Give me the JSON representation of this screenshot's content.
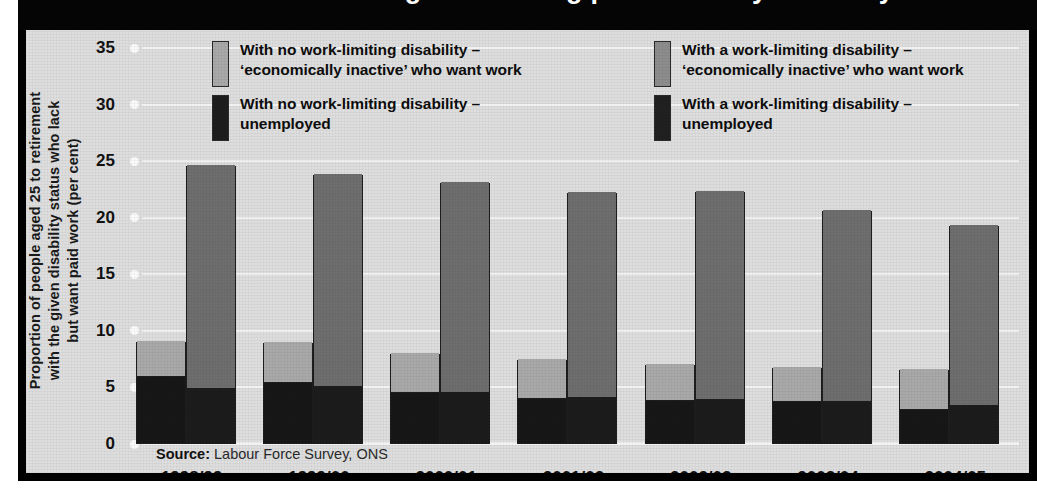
{
  "title": "Lacking but wanting paid work: by disability status",
  "ylabel_lines": [
    "Proportion of people aged 25 to retirement",
    "with the given disability status who lack",
    "but want paid work (per cent)"
  ],
  "source": {
    "prefix": "Source:",
    "text": " Labour Force Survey, ONS"
  },
  "legend": [
    {
      "swatch": "sw-nodis-inactive",
      "icon": "legend-swatch-light-grey",
      "line1": "With no work-limiting disability –",
      "line2": "‘economically inactive’ who want work"
    },
    {
      "swatch": "sw-nodis-unemp",
      "icon": "legend-swatch-black",
      "line1": "With no work-limiting disability –",
      "line2": "unemployed"
    },
    {
      "swatch": "sw-dis-inactive",
      "icon": "legend-swatch-mid-grey",
      "line1": "With a work-limiting disability –",
      "line2": "‘economically inactive’ who want work"
    },
    {
      "swatch": "sw-dis-unemp",
      "icon": "legend-swatch-dark",
      "line1": "With a work-limiting disability –",
      "line2": "unemployed"
    }
  ],
  "colors": {
    "panel_background": "#dedede",
    "frame": "#000000",
    "gridline": "#f4f4f4",
    "no_disability_inactive": "#a9a9a9",
    "no_disability_unemployed": "#171717",
    "disability_inactive": "#6e6e6e",
    "disability_unemployed": "#1c1c1c"
  },
  "chart_data": {
    "type": "bar",
    "subtype": "grouped-stacked",
    "title": "Lacking but wanting paid work: by disability status",
    "xlabel": "",
    "ylabel": "Proportion of people aged 25 to retirement with the given disability status who lack but want paid work (per cent)",
    "ylim": [
      0,
      35
    ],
    "yticks": [
      0,
      5,
      10,
      15,
      20,
      25,
      30,
      35
    ],
    "ytick_labels": [
      "0",
      "5",
      "10",
      "15",
      "20",
      "25",
      "30",
      "35"
    ],
    "grid": true,
    "legend_position": "top",
    "categories": [
      "1998/99",
      "1999/00",
      "2000/01",
      "2001/02",
      "2002/03",
      "2003/04",
      "2004/05"
    ],
    "series": [
      {
        "name": "With no work-limiting disability – unemployed",
        "group": "no-disability",
        "stack_order": 1,
        "color": "#171717",
        "values": [
          5.9,
          5.4,
          4.5,
          4.0,
          3.8,
          3.7,
          3.0
        ]
      },
      {
        "name": "With no work-limiting disability – ‘economically inactive’ who want work",
        "group": "no-disability",
        "stack_order": 2,
        "color": "#a9a9a9",
        "values": [
          3.1,
          3.5,
          3.5,
          3.4,
          3.2,
          3.0,
          3.5
        ]
      },
      {
        "name": "With a work-limiting disability – unemployed",
        "group": "disability",
        "stack_order": 1,
        "color": "#1c1c1c",
        "values": [
          4.9,
          5.0,
          4.5,
          4.1,
          3.9,
          3.7,
          3.4
        ]
      },
      {
        "name": "With a work-limiting disability – ‘economically inactive’ who want work",
        "group": "disability",
        "stack_order": 2,
        "color": "#6e6e6e",
        "values": [
          19.7,
          18.8,
          18.6,
          18.1,
          18.4,
          16.9,
          15.9
        ]
      }
    ],
    "totals": {
      "no-disability": [
        9.0,
        8.9,
        8.0,
        7.4,
        7.0,
        6.7,
        6.5
      ],
      "disability": [
        24.6,
        23.8,
        23.1,
        22.2,
        22.3,
        20.6,
        19.3
      ]
    }
  }
}
